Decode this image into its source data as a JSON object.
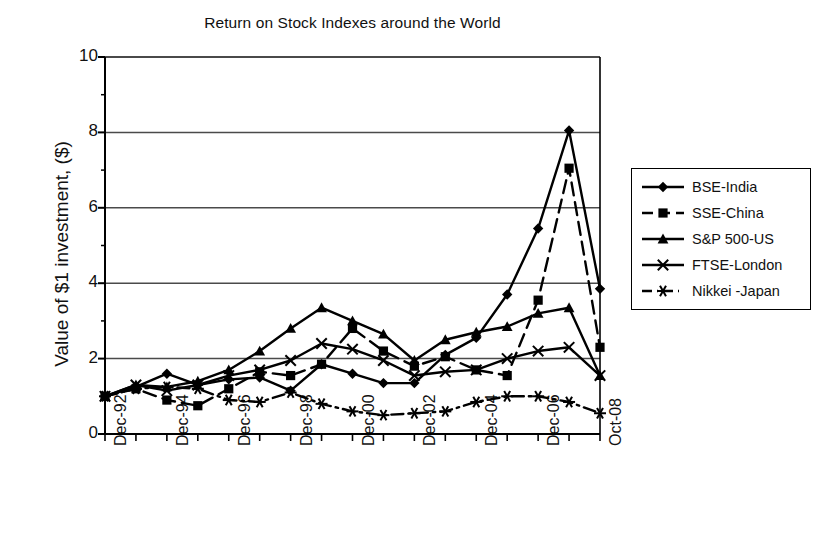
{
  "chart_data": {
    "type": "line",
    "title": "Return on Stock Indexes around the World",
    "xlabel": "",
    "ylabel": "Value of $1 investment, ($)",
    "ylim": [
      0,
      10
    ],
    "yticks": [
      0,
      2,
      4,
      6,
      8,
      10
    ],
    "grid": "horizontal",
    "legend_position": "right",
    "x": [
      "Dec-92",
      "Dec-93",
      "Dec-94",
      "Dec-95",
      "Dec-96",
      "Dec-97",
      "Dec-98",
      "Dec-99",
      "Dec-00",
      "Dec-01",
      "Dec-02",
      "Dec-03",
      "Dec-04",
      "Dec-05",
      "Dec-06",
      "Dec-07",
      "Oct-08"
    ],
    "tick_labels": [
      "Dec-92",
      "",
      "Dec-94",
      "",
      "Dec-96",
      "",
      "Dec-98",
      "",
      "Dec-00",
      "",
      "Dec-02",
      "",
      "Dec-04",
      "",
      "Dec-06",
      "",
      "Oct-08"
    ],
    "series": [
      {
        "name": "BSE-India",
        "marker": "diamond",
        "dash": "solid",
        "values": [
          1.0,
          1.25,
          1.6,
          1.3,
          1.45,
          1.5,
          1.15,
          1.85,
          1.6,
          1.35,
          1.35,
          2.1,
          2.55,
          3.7,
          5.45,
          8.05,
          3.85
        ]
      },
      {
        "name": "SSE-China",
        "marker": "square",
        "dash": "dashed",
        "values": [
          1.0,
          1.2,
          0.9,
          0.75,
          1.2,
          1.65,
          1.55,
          1.85,
          2.8,
          2.2,
          1.8,
          2.05,
          1.7,
          1.55,
          3.55,
          7.05,
          2.3
        ]
      },
      {
        "name": "S&P 500-US",
        "marker": "triangle",
        "dash": "solid",
        "values": [
          1.0,
          1.3,
          1.25,
          1.4,
          1.7,
          2.2,
          2.8,
          3.35,
          3.0,
          2.65,
          1.95,
          2.5,
          2.7,
          2.85,
          3.2,
          3.35,
          1.55
        ]
      },
      {
        "name": "FTSE-London",
        "marker": "cross",
        "dash": "solid",
        "values": [
          1.0,
          1.3,
          1.15,
          1.3,
          1.55,
          1.7,
          1.95,
          2.4,
          2.25,
          1.95,
          1.55,
          1.65,
          1.7,
          2.0,
          2.2,
          2.3,
          1.55
        ]
      },
      {
        "name": "Nikkei -Japan",
        "marker": "asterisk",
        "dash": "dashdot",
        "values": [
          1.0,
          1.2,
          1.25,
          1.2,
          0.9,
          0.85,
          1.1,
          0.8,
          0.6,
          0.5,
          0.55,
          0.6,
          0.85,
          1.0,
          1.0,
          0.85,
          0.55
        ]
      }
    ]
  },
  "legend": {
    "items": [
      {
        "label": "BSE-India"
      },
      {
        "label": "SSE-China"
      },
      {
        "label": "S&P 500-US"
      },
      {
        "label": "FTSE-London"
      },
      {
        "label": "Nikkei -Japan"
      }
    ]
  },
  "colors": {
    "ink": "#000000",
    "background": "#ffffff",
    "grid": "#4a4a4a"
  }
}
